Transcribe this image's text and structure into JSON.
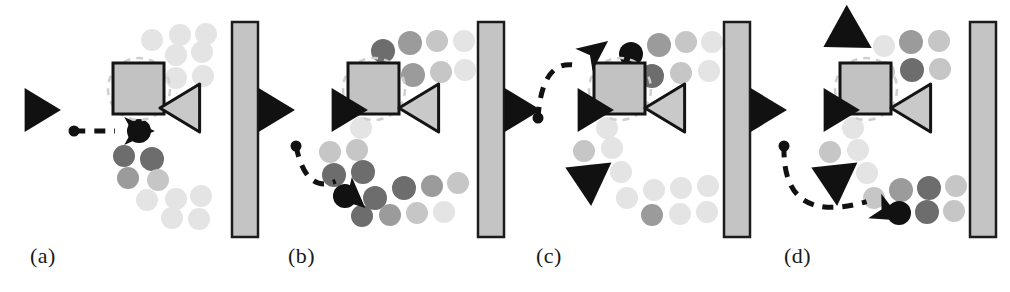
{
  "figure": {
    "width": 1010,
    "height": 292,
    "background": "#ffffff"
  },
  "colors": {
    "agent_black": "#111111",
    "goal_gray": "#c9c9c9",
    "goal_outline": "#141414",
    "obstacle_fill": "#c2c2c2",
    "obstacle_border": "#141414",
    "wall_fill": "#c4c4c4",
    "wall_border": "#1c1c1c",
    "dot_darkest": "#111111",
    "dot_dark": "#6d6d6d",
    "dot_mid": "#9b9b9b",
    "dot_light": "#c6c6c6",
    "dot_faint": "#e4e4e4",
    "arrow_dash": "#111111",
    "ghost_ring": "#cfcfcf",
    "label_text": "#1a1a1a"
  },
  "panels": [
    {
      "id": "a",
      "label": "(a)",
      "label_x": 30,
      "label_y": 243,
      "origin_x": 0,
      "wall": {
        "x": 232,
        "y": 22,
        "w": 26,
        "h": 215
      },
      "obstacle": {
        "x": 113,
        "y": 63,
        "w": 51,
        "h": 51
      },
      "ghost_ring": {
        "x": 108,
        "y": 58,
        "d": 62
      },
      "goal_triangle": {
        "x": 185,
        "y": 108,
        "size": 24
      },
      "agent_triangle": {
        "x": 38,
        "y": 110,
        "size": 22
      },
      "arrow": {
        "start_x": 74,
        "start_y": 131,
        "end_x": 137,
        "end_y": 131,
        "ctrl_x": 105,
        "ctrl_y": 131,
        "head_angle": 0
      },
      "dots": [
        {
          "x": 139,
          "y": 131,
          "r": 12,
          "shade": "dot_darkest"
        },
        {
          "x": 124,
          "y": 156,
          "r": 11,
          "shade": "dot_dark"
        },
        {
          "x": 152,
          "y": 159,
          "r": 12,
          "shade": "dot_dark"
        },
        {
          "x": 128,
          "y": 178,
          "r": 11,
          "shade": "dot_mid"
        },
        {
          "x": 158,
          "y": 180,
          "r": 11,
          "shade": "dot_light"
        },
        {
          "x": 147,
          "y": 200,
          "r": 11,
          "shade": "dot_faint"
        },
        {
          "x": 176,
          "y": 199,
          "r": 11,
          "shade": "dot_faint"
        },
        {
          "x": 201,
          "y": 196,
          "r": 11,
          "shade": "dot_faint"
        },
        {
          "x": 172,
          "y": 218,
          "r": 11,
          "shade": "dot_faint"
        },
        {
          "x": 199,
          "y": 219,
          "r": 11,
          "shade": "dot_faint"
        },
        {
          "x": 176,
          "y": 55,
          "r": 11,
          "shade": "dot_faint"
        },
        {
          "x": 202,
          "y": 52,
          "r": 11,
          "shade": "dot_faint"
        },
        {
          "x": 176,
          "y": 78,
          "r": 11,
          "shade": "dot_faint"
        },
        {
          "x": 203,
          "y": 76,
          "r": 11,
          "shade": "dot_faint"
        },
        {
          "x": 152,
          "y": 40,
          "r": 11,
          "shade": "dot_faint"
        },
        {
          "x": 180,
          "y": 35,
          "r": 11,
          "shade": "dot_faint"
        },
        {
          "x": 206,
          "y": 34,
          "r": 11,
          "shade": "dot_faint"
        }
      ]
    },
    {
      "id": "b",
      "label": "(b)",
      "label_x": 288,
      "label_y": 243,
      "origin_x": 250,
      "wall": {
        "x": 478,
        "y": 22,
        "w": 26,
        "h": 215
      },
      "obstacle": {
        "x": 348,
        "y": 63,
        "w": 51,
        "h": 51
      },
      "ghost_ring": {
        "x": 343,
        "y": 58,
        "d": 62
      },
      "goal_triangle": {
        "x": 424,
        "y": 108,
        "size": 24
      },
      "agent_triangle": {
        "x": 272,
        "y": 110,
        "size": 22
      },
      "secondary_triangle": {
        "x": 345,
        "y": 110,
        "size": 22
      },
      "arrow": {
        "start_x": 296,
        "start_y": 146,
        "end_x": 352,
        "end_y": 196,
        "ctrl_x": 306,
        "ctrl_y": 194,
        "head_angle": 42
      },
      "dots": [
        {
          "x": 383,
          "y": 51,
          "r": 12,
          "shade": "dot_dark"
        },
        {
          "x": 410,
          "y": 43,
          "r": 12,
          "shade": "dot_mid"
        },
        {
          "x": 437,
          "y": 41,
          "r": 11,
          "shade": "dot_light"
        },
        {
          "x": 464,
          "y": 41,
          "r": 11,
          "shade": "dot_faint"
        },
        {
          "x": 413,
          "y": 75,
          "r": 12,
          "shade": "dot_mid"
        },
        {
          "x": 441,
          "y": 72,
          "r": 11,
          "shade": "dot_light"
        },
        {
          "x": 465,
          "y": 70,
          "r": 11,
          "shade": "dot_faint"
        },
        {
          "x": 361,
          "y": 128,
          "r": 11,
          "shade": "dot_faint"
        },
        {
          "x": 330,
          "y": 152,
          "r": 11,
          "shade": "dot_light"
        },
        {
          "x": 357,
          "y": 150,
          "r": 11,
          "shade": "dot_light"
        },
        {
          "x": 334,
          "y": 175,
          "r": 12,
          "shade": "dot_dark"
        },
        {
          "x": 363,
          "y": 172,
          "r": 12,
          "shade": "dot_dark"
        },
        {
          "x": 345,
          "y": 196,
          "r": 12,
          "shade": "dot_darkest"
        },
        {
          "x": 375,
          "y": 198,
          "r": 12,
          "shade": "dot_dark"
        },
        {
          "x": 404,
          "y": 188,
          "r": 12,
          "shade": "dot_dark"
        },
        {
          "x": 432,
          "y": 186,
          "r": 11,
          "shade": "dot_mid"
        },
        {
          "x": 458,
          "y": 183,
          "r": 11,
          "shade": "dot_light"
        },
        {
          "x": 362,
          "y": 216,
          "r": 11,
          "shade": "dot_dark"
        },
        {
          "x": 390,
          "y": 215,
          "r": 11,
          "shade": "dot_mid"
        },
        {
          "x": 417,
          "y": 213,
          "r": 11,
          "shade": "dot_light"
        },
        {
          "x": 444,
          "y": 212,
          "r": 11,
          "shade": "dot_faint"
        }
      ]
    },
    {
      "id": "c",
      "label": "(c)",
      "label_x": 536,
      "label_y": 243,
      "origin_x": 496,
      "wall": {
        "x": 724,
        "y": 22,
        "w": 26,
        "h": 215
      },
      "obstacle": {
        "x": 594,
        "y": 63,
        "w": 51,
        "h": 51
      },
      "ghost_ring": {
        "x": 589,
        "y": 58,
        "d": 62
      },
      "goal_triangle": {
        "x": 670,
        "y": 108,
        "size": 24
      },
      "agent_triangle": {
        "x": 518,
        "y": 110,
        "size": 22
      },
      "secondary_triangle": {
        "x": 591,
        "y": 110,
        "size": 22
      },
      "lower_triangle": {
        "x": 588,
        "y": 178,
        "size": 24
      },
      "arrow": {
        "start_x": 538,
        "start_y": 118,
        "end_x": 594,
        "end_y": 52,
        "ctrl_x": 542,
        "ctrl_y": 58,
        "head_angle": -38
      },
      "dots": [
        {
          "x": 631,
          "y": 54,
          "r": 12,
          "shade": "dot_darkest"
        },
        {
          "x": 659,
          "y": 45,
          "r": 12,
          "shade": "dot_mid"
        },
        {
          "x": 686,
          "y": 42,
          "r": 11,
          "shade": "dot_light"
        },
        {
          "x": 712,
          "y": 42,
          "r": 11,
          "shade": "dot_faint"
        },
        {
          "x": 652,
          "y": 76,
          "r": 12,
          "shade": "dot_dark"
        },
        {
          "x": 681,
          "y": 73,
          "r": 11,
          "shade": "dot_light"
        },
        {
          "x": 709,
          "y": 71,
          "r": 11,
          "shade": "dot_faint"
        },
        {
          "x": 607,
          "y": 128,
          "r": 11,
          "shade": "dot_faint"
        },
        {
          "x": 584,
          "y": 151,
          "r": 11,
          "shade": "dot_light"
        },
        {
          "x": 612,
          "y": 148,
          "r": 11,
          "shade": "dot_faint"
        },
        {
          "x": 592,
          "y": 175,
          "r": 11,
          "shade": "dot_faint"
        },
        {
          "x": 621,
          "y": 172,
          "r": 11,
          "shade": "dot_faint"
        },
        {
          "x": 627,
          "y": 198,
          "r": 11,
          "shade": "dot_faint"
        },
        {
          "x": 654,
          "y": 190,
          "r": 11,
          "shade": "dot_faint"
        },
        {
          "x": 681,
          "y": 188,
          "r": 11,
          "shade": "dot_faint"
        },
        {
          "x": 708,
          "y": 186,
          "r": 11,
          "shade": "dot_faint"
        },
        {
          "x": 652,
          "y": 215,
          "r": 11,
          "shade": "dot_mid"
        },
        {
          "x": 680,
          "y": 214,
          "r": 11,
          "shade": "dot_faint"
        },
        {
          "x": 707,
          "y": 212,
          "r": 11,
          "shade": "dot_faint"
        }
      ]
    },
    {
      "id": "d",
      "label": "(d)",
      "label_x": 784,
      "label_y": 243,
      "origin_x": 742,
      "wall": {
        "x": 970,
        "y": 22,
        "w": 26,
        "h": 215
      },
      "obstacle": {
        "x": 840,
        "y": 63,
        "w": 51,
        "h": 51
      },
      "ghost_ring": {
        "x": 835,
        "y": 58,
        "d": 62
      },
      "goal_triangle": {
        "x": 916,
        "y": 108,
        "size": 24
      },
      "agent_triangle": {
        "x": 764,
        "y": 110,
        "size": 22
      },
      "secondary_triangle": {
        "x": 837,
        "y": 110,
        "size": 22
      },
      "upper_triangle": {
        "x": 846,
        "y": 34,
        "size": 25
      },
      "lower_triangle": {
        "x": 834,
        "y": 178,
        "size": 24
      },
      "arrow": {
        "start_x": 784,
        "start_y": 146,
        "end_x": 886,
        "end_y": 212,
        "ctrl_x": 782,
        "ctrl_y": 226,
        "head_angle": 28
      },
      "dots": [
        {
          "x": 884,
          "y": 46,
          "r": 11,
          "shade": "dot_faint"
        },
        {
          "x": 911,
          "y": 42,
          "r": 12,
          "shade": "dot_mid"
        },
        {
          "x": 939,
          "y": 41,
          "r": 11,
          "shade": "dot_light"
        },
        {
          "x": 884,
          "y": 72,
          "r": 11,
          "shade": "dot_light"
        },
        {
          "x": 912,
          "y": 70,
          "r": 12,
          "shade": "dot_dark"
        },
        {
          "x": 940,
          "y": 69,
          "r": 11,
          "shade": "dot_light"
        },
        {
          "x": 853,
          "y": 128,
          "r": 11,
          "shade": "dot_faint"
        },
        {
          "x": 830,
          "y": 152,
          "r": 11,
          "shade": "dot_light"
        },
        {
          "x": 858,
          "y": 150,
          "r": 11,
          "shade": "dot_faint"
        },
        {
          "x": 838,
          "y": 176,
          "r": 11,
          "shade": "dot_faint"
        },
        {
          "x": 867,
          "y": 173,
          "r": 11,
          "shade": "dot_faint"
        },
        {
          "x": 874,
          "y": 198,
          "r": 11,
          "shade": "dot_light"
        },
        {
          "x": 901,
          "y": 190,
          "r": 12,
          "shade": "dot_mid"
        },
        {
          "x": 929,
          "y": 188,
          "r": 12,
          "shade": "dot_dark"
        },
        {
          "x": 956,
          "y": 186,
          "r": 11,
          "shade": "dot_light"
        },
        {
          "x": 899,
          "y": 213,
          "r": 12,
          "shade": "dot_darkest"
        },
        {
          "x": 927,
          "y": 212,
          "r": 12,
          "shade": "dot_dark"
        },
        {
          "x": 954,
          "y": 211,
          "r": 11,
          "shade": "dot_light"
        }
      ]
    }
  ]
}
